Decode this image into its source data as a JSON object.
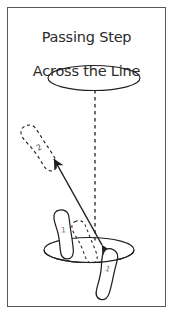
{
  "figure": {
    "title_line_1": "Passing Step",
    "title_line_2": "Across the Line",
    "title_full": "Passing Step Across the Line",
    "background_color": "#ffffff",
    "border_color": "#555759",
    "ink_color": "#231f20"
  },
  "labels": {
    "foot_1_left_label": "1",
    "foot_1_right_label": "1",
    "foot_2_label": "2"
  },
  "elements": {
    "upper_ellipse_name": "upper-ellipse",
    "lower_ellipse_name": "lower-ellipse",
    "center_dashed_line_name": "vertical-dashed-line",
    "movement_arrow_name": "movement-arrow",
    "solid_foot_left_name": "solid-footprint-left",
    "solid_foot_right_name": "solid-footprint-right",
    "dashed_foot_lower_name": "dashed-footprint-lower",
    "dashed_foot_upper_name": "dashed-footprint-upper"
  }
}
